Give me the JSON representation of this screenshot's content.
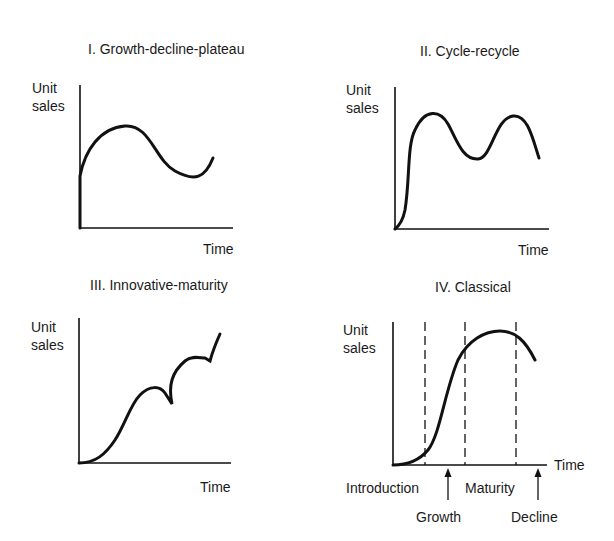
{
  "panels": [
    {
      "id": "I",
      "title": "I. Growth-decline-plateau",
      "ylabel_line1": "Unit",
      "ylabel_line2": "sales",
      "xlabel": "Time",
      "title_pos": [
        88,
        41
      ],
      "ylabel_pos": [
        32,
        80
      ],
      "xlabel_pos": [
        203,
        241
      ],
      "axes": {
        "x0": 80,
        "ytop": 85,
        "ybottom": 228,
        "xright": 233
      },
      "curve": "M80,228 L80,176 C85,150 100,128 125,126 C150,124 155,160 175,171 C195,182 205,178 213,158"
    },
    {
      "id": "II",
      "title": "II. Cycle-recycle",
      "ylabel_line1": "Unit",
      "ylabel_line2": "sales",
      "xlabel": "Time",
      "title_pos": [
        420,
        43
      ],
      "ylabel_pos": [
        346,
        82
      ],
      "xlabel_pos": [
        518,
        242
      ],
      "axes": {
        "x0": 395,
        "ytop": 87,
        "ybottom": 229,
        "xright": 549
      },
      "curve": "M395,229 C400,225 403,220 405,210 C410,180 407,145 415,130 C425,108 440,110 448,124 C456,138 462,160 478,159 C492,158 495,118 513,116 C528,114 533,140 539,158"
    },
    {
      "id": "III",
      "title": "III. Innovative-maturity",
      "ylabel_line1": "Unit",
      "ylabel_line2": "sales",
      "xlabel": "Time",
      "title_pos": [
        90,
        277
      ],
      "ylabel_pos": [
        31,
        319
      ],
      "xlabel_pos": [
        200,
        479
      ],
      "axes": {
        "x0": 79,
        "ytop": 318,
        "ybottom": 463,
        "xright": 231
      },
      "curve": "M79,463 C95,463 105,455 115,440 C125,425 130,405 140,395 C150,385 160,386 165,393 L172,404 C168,385 172,372 185,361 C192,355 200,358 205,358 L210,361 C213,350 215,345 220,334"
    },
    {
      "id": "IV",
      "title": "IV. Classical",
      "ylabel_line1": "Unit",
      "ylabel_line2": "sales",
      "xlabel": "Time",
      "title_pos": [
        435,
        279
      ],
      "ylabel_pos": [
        343,
        322
      ],
      "xlabel_pos": [
        554,
        457
      ],
      "axes": {
        "x0": 393,
        "ytop": 322,
        "ybottom": 465,
        "xright": 547
      },
      "curve": "M393,465 C405,465 418,462 428,450 C440,435 445,390 458,360 C468,340 485,331 500,331 C515,331 525,340 535,360",
      "dashed_x": [
        425,
        465,
        516
      ],
      "phase_labels": [
        {
          "text": "Introduction",
          "x": 346,
          "y": 480
        },
        {
          "text": "Growth",
          "x": 416,
          "y": 509
        },
        {
          "text": "Maturity",
          "x": 465,
          "y": 480
        },
        {
          "text": "Decline",
          "x": 511,
          "y": 509
        }
      ],
      "arrows_x": [
        448,
        538
      ],
      "arrow_top": 468,
      "arrow_bottom": 500
    }
  ]
}
